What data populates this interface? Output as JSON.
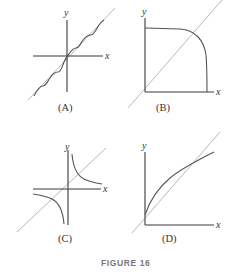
{
  "figure": {
    "title": "FIGURE 16",
    "panels": [
      {
        "id": "A",
        "caption": "(A)",
        "x_label": "x",
        "y_label": "y",
        "description": "wavy curve oscillating around a diagonal line through the origin"
      },
      {
        "id": "B",
        "caption": "(B)",
        "x_label": "x",
        "y_label": "y",
        "description": "quarter superellipse-like curve in first quadrant with diagonal line"
      },
      {
        "id": "C",
        "caption": "(C)",
        "x_label": "x",
        "y_label": "y",
        "description": "hyperbola branches in first and third quadrants with diagonal line"
      },
      {
        "id": "D",
        "caption": "(D)",
        "x_label": "x",
        "y_label": "y",
        "description": "concave increasing curve crossing a diagonal line"
      }
    ]
  },
  "colors": {
    "axis": "#3a3a3a",
    "curve": "#555555",
    "diagonal": "#b8b8b8",
    "figure_label": "#777777"
  }
}
